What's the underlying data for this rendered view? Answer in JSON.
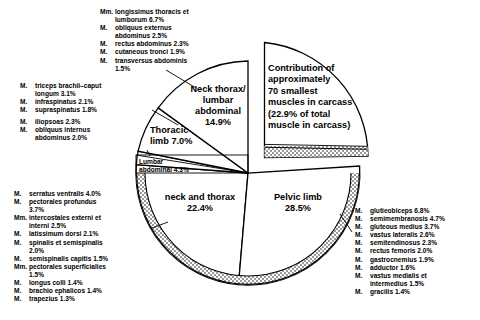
{
  "chart_data": {
    "type": "pie",
    "title": "",
    "subtitle": "",
    "xlabel": "",
    "ylabel": "",
    "legend_position": "none",
    "grid": false,
    "units": "% of total muscle in carcass",
    "categories": [
      "Contribution of approximately 70 smallest muscles in carcass",
      "Neck thorax/lumbar abdominal",
      "Thoracic limb",
      "Lumbar abdominal",
      "neck and thorax",
      "Pelvic limb"
    ],
    "values": [
      22.9,
      14.9,
      7.0,
      4.3,
      22.4,
      28.5
    ],
    "slices": [
      {
        "name": "smallest-muscles",
        "label": "Contribution of approximately 70 smallest muscles in carcass (22.9% of total muscle in carcass)",
        "value": 22.9,
        "exploded": true,
        "start_deg": -90,
        "end_deg": -7.6,
        "hatched_band": true
      },
      {
        "name": "neck-thorax-lumbar-abdominal",
        "label": "Neck thorax/ lumbar abdominal",
        "value": 14.9,
        "exploded": false,
        "start_deg": -90,
        "end_deg": -143.6,
        "hatched_band": false
      },
      {
        "name": "thoracic-limb",
        "label": "Thoracic limb",
        "value": 7.0,
        "exploded": false,
        "start_deg": -143.6,
        "end_deg": -168.8,
        "hatched_band": false
      },
      {
        "name": "lumbar-abdominal",
        "label": "Lumbar abdominal",
        "value": 4.3,
        "exploded": false,
        "start_deg": -168.8,
        "end_deg": -184.3,
        "hatched_band": false
      },
      {
        "name": "neck-and-thorax",
        "label": "neck and thorax",
        "value": 22.4,
        "exploded": false,
        "start_deg": -184.3,
        "end_deg": -264.9,
        "hatched_band": true
      },
      {
        "name": "pelvic-limb",
        "label": "Pelvic limb",
        "value": 28.5,
        "exploded": false,
        "start_deg": -264.9,
        "end_deg": -367.5,
        "hatched_band": true
      }
    ]
  },
  "pie_labels": {
    "neck_thorax_lumbar": "Neck thorax/\nlumbar\nabdominal\n14.9%",
    "neck_thorax_lumbar_l1": "Neck thorax/",
    "neck_thorax_lumbar_l2": "lumbar",
    "neck_thorax_lumbar_l3": "abdominal",
    "neck_thorax_lumbar_l4": "14.9%",
    "thoracic_l1": "Thoracic",
    "thoracic_l2": "limb 7.0%",
    "lumbar_abdominal_l1": "Lumbar",
    "lumbar_abdominal_l2": "abdominal 4.3%",
    "neck_and_thorax_l1": "neck and thorax",
    "neck_and_thorax_l2": "22.4%",
    "pelvic_l1": "Pelvic limb",
    "pelvic_l2": "28.5%",
    "contribution_l1": "Contribution of",
    "contribution_l2": "approximately",
    "contribution_l3": "70 smallest",
    "contribution_l4": "muscles in carcass",
    "contribution_l5": "(22.9% of total",
    "contribution_l6": "muscle in carcass)"
  },
  "lists": {
    "top_center": {
      "name": "lumbar-abdominal-muscle-list",
      "items": [
        {
          "prefix": "Mm.",
          "text": "longissimus thoracis et",
          "cont": "lumborum 6.7%"
        },
        {
          "prefix": "M.",
          "text": "obliquus externus",
          "cont": "abdominus 2.5%"
        },
        {
          "prefix": "M.",
          "text": "rectus abdominus 2.3%",
          "cont": ""
        },
        {
          "prefix": "M.",
          "text": "cutaneous tronci 1.9%",
          "cont": ""
        },
        {
          "prefix": "M.",
          "text": "transversus abdominis",
          "cont": "1.5%"
        }
      ]
    },
    "upper_left": {
      "name": "thoracic-limb-muscle-list",
      "items": [
        {
          "prefix": "M.",
          "text": "triceps brachii–caput",
          "cont": "longum 3.1%"
        },
        {
          "prefix": "M.",
          "text": "infraspinatus 2.1%",
          "cont": ""
        },
        {
          "prefix": "M.",
          "text": "supraspinatus 1.8%",
          "cont": ""
        }
      ]
    },
    "mid_left": {
      "name": "lumbar-abdominal-small-list",
      "items": [
        {
          "prefix": "M.",
          "text": "iliopsoas 2.3%",
          "cont": ""
        },
        {
          "prefix": "M.",
          "text": "obliquus internus",
          "cont": "abdominus 2.0%"
        }
      ]
    },
    "lower_left": {
      "name": "neck-and-thorax-muscle-list",
      "items": [
        {
          "prefix": "M.",
          "text": "serratus ventralis 4.0%",
          "cont": ""
        },
        {
          "prefix": "M.",
          "text": "pectorales profundus",
          "cont": "3.7%"
        },
        {
          "prefix": "Mm.",
          "text": "intercostales externi et",
          "cont": "interni 2.5%"
        },
        {
          "prefix": "M.",
          "text": "latissimum dorsi 2.1%",
          "cont": ""
        },
        {
          "prefix": "M.",
          "text": "spinalis et semispinalis",
          "cont": "2.0%"
        },
        {
          "prefix": "M.",
          "text": "semispinalis capitis 1.5%",
          "cont": ""
        },
        {
          "prefix": "Mm.",
          "text": "pectorales superficialies",
          "cont": "1.5%"
        },
        {
          "prefix": "M.",
          "text": "longus colli 1.4%",
          "cont": ""
        },
        {
          "prefix": "M.",
          "text": "brachio ephalicos 1.4%",
          "cont": ""
        },
        {
          "prefix": "M.",
          "text": "trapezius 1.3%",
          "cont": ""
        }
      ]
    },
    "right": {
      "name": "pelvic-limb-muscle-list",
      "items": [
        {
          "prefix": "M.",
          "text": "glutieobiceps 6.8%",
          "cont": ""
        },
        {
          "prefix": "M.",
          "text": "semimembranosis 4.7%",
          "cont": ""
        },
        {
          "prefix": "M.",
          "text": "gluteous medius 3.7%",
          "cont": ""
        },
        {
          "prefix": "M.",
          "text": "vastus lateralis 2.6%",
          "cont": ""
        },
        {
          "prefix": "M.",
          "text": "semitendinosus 2.3%",
          "cont": ""
        },
        {
          "prefix": "M.",
          "text": "rectus femoris 2.0%",
          "cont": ""
        },
        {
          "prefix": "M.",
          "text": "gastrocnemius 1.9%",
          "cont": ""
        },
        {
          "prefix": "M.",
          "text": "adductor 1.6%",
          "cont": ""
        },
        {
          "prefix": "M.",
          "text": "vastus medialis et",
          "cont": "intermedius 1.5%"
        },
        {
          "prefix": "M.",
          "text": "gracilis 1.4%",
          "cont": ""
        }
      ]
    }
  },
  "colors": {
    "stroke": "#000000",
    "fill": "#ffffff",
    "background": "#ffffff",
    "band": "#d9d9d9"
  }
}
